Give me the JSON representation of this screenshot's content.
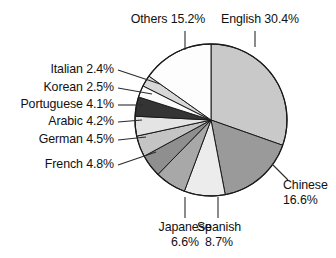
{
  "chart_data": {
    "type": "pie",
    "title": "",
    "subtitle": "",
    "xlabel": "",
    "ylabel": "",
    "legend_position": "none",
    "grid": false,
    "units": "percent",
    "start_angle_deg": 0,
    "direction": "clockwise",
    "categories": [
      "English",
      "Chinese",
      "Spanish",
      "Japanese",
      "French",
      "German",
      "Arabic",
      "Portuguese",
      "Korean",
      "Italian",
      "Others"
    ],
    "values": [
      30.4,
      16.6,
      8.7,
      6.6,
      4.8,
      4.5,
      4.2,
      4.1,
      2.5,
      2.4,
      15.2
    ],
    "slices": [
      {
        "name": "English",
        "value": 30.4,
        "value_text": "30.4%",
        "color": "#c9c9c9"
      },
      {
        "name": "Chinese",
        "value": 16.6,
        "value_text": "16.6%",
        "color": "#9a9a9a"
      },
      {
        "name": "Spanish",
        "value": 8.7,
        "value_text": "8.7%",
        "color": "#ececec"
      },
      {
        "name": "Japanese",
        "value": 6.6,
        "value_text": "6.6%",
        "color": "#a8a8a8"
      },
      {
        "name": "French",
        "value": 4.8,
        "value_text": "4.8%",
        "color": "#8f8f8f"
      },
      {
        "name": "German",
        "value": 4.5,
        "value_text": "4.5%",
        "color": "#c4c4c4"
      },
      {
        "name": "Arabic",
        "value": 4.2,
        "value_text": "4.2%",
        "color": "#e4e4e4"
      },
      {
        "name": "Portuguese",
        "value": 4.1,
        "value_text": "4.1%",
        "color": "#343434"
      },
      {
        "name": "Korean",
        "value": 2.5,
        "value_text": "2.5%",
        "color": "#fbfbfb"
      },
      {
        "name": "Italian",
        "value": 2.4,
        "value_text": "2.4%",
        "color": "#d8d8d8"
      },
      {
        "name": "Others",
        "value": 15.2,
        "value_text": "15.2%",
        "color": "#fdfdfd"
      }
    ]
  },
  "labels": {
    "others": "Others 15.2%",
    "english": "English 30.4%",
    "italian": "Italian 2.4%",
    "korean": "Korean 2.5%",
    "portuguese": "Portuguese 4.1%",
    "arabic": "Arabic 4.2%",
    "german": "German 4.5%",
    "french": "French 4.8%",
    "japanese_name": "Japanese",
    "japanese_value": "6.6%",
    "spanish_name": "Spanish",
    "spanish_value": "8.7%",
    "chinese_name": "Chinese",
    "chinese_value": "16.6%"
  },
  "style": {
    "background": "#ffffff",
    "outline": "#1a1a1a",
    "leader_line": "#2b2b2b"
  }
}
